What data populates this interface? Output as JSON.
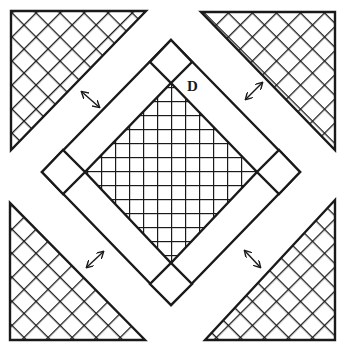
{
  "diagram": {
    "type": "quilt-block-layout",
    "colors": {
      "stroke": "#1a1a1a",
      "background": "#ffffff"
    },
    "label": {
      "text": "D",
      "x": 187,
      "y": 79
    },
    "center_square": {
      "pattern": "square-grid",
      "points": [
        [
          171,
          83
        ],
        [
          257,
          172
        ],
        [
          171,
          263
        ],
        [
          85,
          172
        ]
      ],
      "grid_spacing": 14
    },
    "border_frame": {
      "points": [
        [
          171,
          40
        ],
        [
          300,
          172
        ],
        [
          171,
          305
        ],
        [
          42,
          172
        ]
      ]
    },
    "corner_squares": [
      {
        "name": "top",
        "points": [
          [
            171,
            40
          ],
          [
            192,
            62
          ],
          [
            171,
            83
          ],
          [
            150,
            62
          ]
        ]
      },
      {
        "name": "right",
        "points": [
          [
            300,
            172
          ],
          [
            279,
            194
          ],
          [
            257,
            172
          ],
          [
            279,
            150
          ]
        ]
      },
      {
        "name": "bottom",
        "points": [
          [
            171,
            305
          ],
          [
            150,
            284
          ],
          [
            171,
            263
          ],
          [
            192,
            284
          ]
        ]
      },
      {
        "name": "left",
        "points": [
          [
            42,
            172
          ],
          [
            63,
            150
          ],
          [
            85,
            172
          ],
          [
            63,
            194
          ]
        ]
      }
    ],
    "corner_triangles": [
      {
        "name": "top-left",
        "pattern": "diagonal-crosshatch",
        "points": [
          [
            11,
            11
          ],
          [
            146,
            11
          ],
          [
            11,
            150
          ]
        ]
      },
      {
        "name": "top-right",
        "pattern": "diagonal-crosshatch",
        "points": [
          [
            201,
            12
          ],
          [
            335,
            12
          ],
          [
            335,
            150
          ]
        ]
      },
      {
        "name": "bottom-left",
        "pattern": "diagonal-crosshatch",
        "points": [
          [
            10,
            203
          ],
          [
            10,
            340
          ],
          [
            145,
            340
          ]
        ]
      },
      {
        "name": "bottom-right",
        "pattern": "diagonal-crosshatch",
        "points": [
          [
            335,
            200
          ],
          [
            335,
            340
          ],
          [
            205,
            340
          ]
        ]
      }
    ],
    "arrows": [
      {
        "name": "top-left",
        "from": [
          82,
          92
        ],
        "to": [
          99,
          107
        ],
        "glyph": "double-headed-arrow"
      },
      {
        "name": "top-right",
        "from": [
          246,
          99
        ],
        "to": [
          262,
          83
        ],
        "glyph": "double-headed-arrow"
      },
      {
        "name": "bottom-left",
        "from": [
          87,
          267
        ],
        "to": [
          103,
          252
        ],
        "glyph": "double-headed-arrow"
      },
      {
        "name": "bottom-right",
        "from": [
          245,
          251
        ],
        "to": [
          260,
          267
        ],
        "glyph": "double-headed-arrow"
      }
    ]
  }
}
